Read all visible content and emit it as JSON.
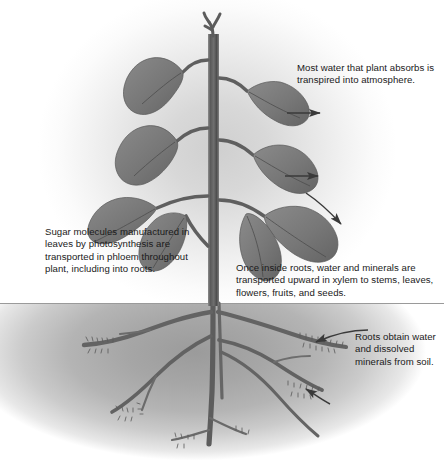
{
  "figure": {
    "ground_line_label": "soil surface"
  },
  "callouts": [
    {
      "id": "transpiration",
      "text": "Most water that plant absorbs is transpired into atmosphere."
    },
    {
      "id": "phloem",
      "text": "Sugar molecules manufactured in leaves by photosynthesis are transported in phloem throughout plant, including into roots."
    },
    {
      "id": "xylem",
      "text": "Once inside roots, water and minerals are transported upward in xylem to stems, leaves, flowers, fruits, and seeds."
    },
    {
      "id": "absorption",
      "text": "Roots obtain water and dissolved minerals from soil."
    }
  ],
  "parts": {
    "stem": "stem",
    "apex": "shoot-apex",
    "leaves": "leaves",
    "taproot": "taproot",
    "lateral_roots": "lateral-roots",
    "root_hairs": "root-hairs"
  },
  "arrows": {
    "transpiration_upper": "water vapor leaving upper leaf",
    "transpiration_middle": "water vapor leaving middle leaf",
    "transpiration_lower": "water vapor leaving lower leaf",
    "uptake_upper": "water entering upper lateral root",
    "uptake_lower": "water entering lower lateral root"
  },
  "colors": {
    "plant": "#6e6e6e",
    "plant_dark": "#4a4a4a",
    "leaf": "#7a7a7a",
    "leaf_shadow": "#5e5e5e",
    "soil": "#a6a6a6",
    "background": "#ffffff",
    "text": "#1a1a1a",
    "arrow": "#3a3a3a"
  }
}
